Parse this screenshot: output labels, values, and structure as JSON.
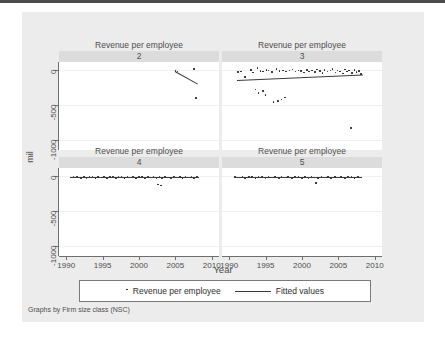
{
  "figure": {
    "axis_title_y": "mil",
    "axis_title_x": "Year",
    "note": "Graphs by Firm size class (NSC)",
    "background": "#ececec",
    "panel_background": "#ffffff",
    "strip_background": "#dcdcdc",
    "marker_color": "#1a1a1a",
    "line_color": "#3a3a3a"
  },
  "legend": {
    "items": [
      {
        "marker": "dot",
        "label": "Revenue per employee"
      },
      {
        "marker": "line",
        "label": "Fitted values"
      }
    ]
  },
  "chart_data": {
    "type": "scatter",
    "title": "",
    "xlabel": "Year",
    "ylabel": "mil",
    "xlim": [
      1989,
      2011
    ],
    "ylim": [
      -1150,
      120
    ],
    "xticks": [
      1990,
      1995,
      2000,
      2005,
      2010
    ],
    "yticks": [
      0,
      -500,
      -1000
    ],
    "ytick_labels": [
      "0",
      "-500",
      "-1000"
    ],
    "xtick_labels": [
      "1990",
      "1995",
      "2000",
      "2005",
      "2010"
    ],
    "grid": "horizontal",
    "legend_position": "bottom",
    "facet_by": "Firm size class (NSC)",
    "panels": [
      {
        "title": "Revenue per employee",
        "subtitle": "2",
        "row": 0,
        "col": 0,
        "points": [
          {
            "x": 2005.0,
            "y": -10
          },
          {
            "x": 2005.3,
            "y": -15
          },
          {
            "x": 2007.6,
            "y": 20
          },
          {
            "x": 2007.8,
            "y": -400
          }
        ],
        "fit": {
          "x0": 2004.9,
          "y0": -5,
          "x1": 2008.0,
          "y1": -185
        }
      },
      {
        "title": "Revenue per employee",
        "subtitle": "3",
        "row": 0,
        "col": 1,
        "points": [
          {
            "x": 1991.2,
            "y": -25
          },
          {
            "x": 1991.6,
            "y": -15
          },
          {
            "x": 1992.2,
            "y": -95
          },
          {
            "x": 1993.0,
            "y": 5
          },
          {
            "x": 1993.3,
            "y": -30
          },
          {
            "x": 1993.9,
            "y": 30
          },
          {
            "x": 1994.3,
            "y": -10
          },
          {
            "x": 1994.6,
            "y": -20
          },
          {
            "x": 1995.1,
            "y": 5
          },
          {
            "x": 1995.4,
            "y": -5
          },
          {
            "x": 1995.9,
            "y": -25
          },
          {
            "x": 1996.5,
            "y": 15
          },
          {
            "x": 1996.9,
            "y": -10
          },
          {
            "x": 1997.4,
            "y": 0
          },
          {
            "x": 1997.8,
            "y": -15
          },
          {
            "x": 1998.3,
            "y": -5
          },
          {
            "x": 1998.7,
            "y": 10
          },
          {
            "x": 1999.1,
            "y": -20
          },
          {
            "x": 1999.5,
            "y": 0
          },
          {
            "x": 1999.9,
            "y": -10
          },
          {
            "x": 2000.3,
            "y": -30
          },
          {
            "x": 2000.7,
            "y": 5
          },
          {
            "x": 2001.0,
            "y": -15
          },
          {
            "x": 2001.4,
            "y": 0
          },
          {
            "x": 2001.8,
            "y": -25
          },
          {
            "x": 2002.1,
            "y": 10
          },
          {
            "x": 2002.5,
            "y": -10
          },
          {
            "x": 2002.8,
            "y": -35
          },
          {
            "x": 2003.1,
            "y": 5
          },
          {
            "x": 2003.5,
            "y": -20
          },
          {
            "x": 2003.9,
            "y": -5
          },
          {
            "x": 2004.2,
            "y": 15
          },
          {
            "x": 2004.6,
            "y": -30
          },
          {
            "x": 2004.9,
            "y": 0
          },
          {
            "x": 2005.2,
            "y": -15
          },
          {
            "x": 2005.6,
            "y": -45
          },
          {
            "x": 2005.9,
            "y": 10
          },
          {
            "x": 2006.2,
            "y": -20
          },
          {
            "x": 2006.5,
            "y": -5
          },
          {
            "x": 2006.9,
            "y": -35
          },
          {
            "x": 2007.2,
            "y": 5
          },
          {
            "x": 2007.5,
            "y": -25
          },
          {
            "x": 2007.8,
            "y": -10
          },
          {
            "x": 2008.1,
            "y": -50
          },
          {
            "x": 1993.6,
            "y": -275
          },
          {
            "x": 1994.0,
            "y": -330
          },
          {
            "x": 1994.6,
            "y": -300
          },
          {
            "x": 1995.0,
            "y": -360
          },
          {
            "x": 1996.1,
            "y": -460
          },
          {
            "x": 1996.7,
            "y": -440
          },
          {
            "x": 1997.2,
            "y": -420
          },
          {
            "x": 1997.7,
            "y": -395
          },
          {
            "x": 2006.7,
            "y": -830
          }
        ],
        "fit": {
          "x0": 1991.0,
          "y0": -135,
          "x1": 2008.3,
          "y1": -55
        }
      },
      {
        "title": "Revenue per employee",
        "subtitle": "4",
        "row": 1,
        "col": 0,
        "points": [
          {
            "x": 1990.6,
            "y": -18
          },
          {
            "x": 1991.0,
            "y": -14
          },
          {
            "x": 1991.5,
            "y": -10
          },
          {
            "x": 1992.0,
            "y": -22
          },
          {
            "x": 1992.4,
            "y": -6
          },
          {
            "x": 1992.8,
            "y": -30
          },
          {
            "x": 1993.2,
            "y": -12
          },
          {
            "x": 1993.6,
            "y": -2
          },
          {
            "x": 1994.0,
            "y": -26
          },
          {
            "x": 1994.4,
            "y": -8
          },
          {
            "x": 1994.8,
            "y": -18
          },
          {
            "x": 1995.2,
            "y": -4
          },
          {
            "x": 1995.6,
            "y": -34
          },
          {
            "x": 1996.0,
            "y": -14
          },
          {
            "x": 1996.4,
            "y": -6
          },
          {
            "x": 1996.8,
            "y": -24
          },
          {
            "x": 1997.2,
            "y": -10
          },
          {
            "x": 1997.6,
            "y": -2
          },
          {
            "x": 1998.0,
            "y": -28
          },
          {
            "x": 1998.4,
            "y": -12
          },
          {
            "x": 1998.8,
            "y": -20
          },
          {
            "x": 1999.2,
            "y": -6
          },
          {
            "x": 1999.6,
            "y": -32
          },
          {
            "x": 2000.0,
            "y": -14
          },
          {
            "x": 2000.4,
            "y": -4
          },
          {
            "x": 2000.8,
            "y": -24
          },
          {
            "x": 2001.2,
            "y": -10
          },
          {
            "x": 2001.6,
            "y": -18
          },
          {
            "x": 2002.0,
            "y": -2
          },
          {
            "x": 2002.4,
            "y": -30
          },
          {
            "x": 2002.8,
            "y": -12
          },
          {
            "x": 2003.2,
            "y": -22
          },
          {
            "x": 2003.6,
            "y": -6
          },
          {
            "x": 2004.0,
            "y": -16
          },
          {
            "x": 2004.4,
            "y": -26
          },
          {
            "x": 2004.8,
            "y": -8
          },
          {
            "x": 2005.2,
            "y": -18
          },
          {
            "x": 2005.6,
            "y": -4
          },
          {
            "x": 2006.0,
            "y": -28
          },
          {
            "x": 2006.4,
            "y": -12
          },
          {
            "x": 2006.8,
            "y": -20
          },
          {
            "x": 2007.2,
            "y": -6
          },
          {
            "x": 2007.6,
            "y": -24
          },
          {
            "x": 2008.0,
            "y": -14
          },
          {
            "x": 2002.6,
            "y": -120
          },
          {
            "x": 2003.0,
            "y": -135
          }
        ],
        "fit": {
          "x0": 1990.5,
          "y0": -16,
          "x1": 2008.2,
          "y1": -16
        }
      },
      {
        "title": "Revenue per employee",
        "subtitle": "5",
        "row": 1,
        "col": 1,
        "points": [
          {
            "x": 1990.8,
            "y": -10
          },
          {
            "x": 1991.3,
            "y": -20
          },
          {
            "x": 1991.8,
            "y": -6
          },
          {
            "x": 1992.2,
            "y": -28
          },
          {
            "x": 1992.7,
            "y": -12
          },
          {
            "x": 1993.1,
            "y": -2
          },
          {
            "x": 1993.6,
            "y": -24
          },
          {
            "x": 1994.0,
            "y": -14
          },
          {
            "x": 1994.5,
            "y": -6
          },
          {
            "x": 1995.0,
            "y": -30
          },
          {
            "x": 1995.4,
            "y": -10
          },
          {
            "x": 1995.9,
            "y": -20
          },
          {
            "x": 1996.3,
            "y": -4
          },
          {
            "x": 1996.8,
            "y": -26
          },
          {
            "x": 1997.2,
            "y": -12
          },
          {
            "x": 1997.7,
            "y": -18
          },
          {
            "x": 1998.1,
            "y": -2
          },
          {
            "x": 1998.6,
            "y": -28
          },
          {
            "x": 1999.0,
            "y": -14
          },
          {
            "x": 1999.5,
            "y": -8
          },
          {
            "x": 2000.0,
            "y": -22
          },
          {
            "x": 2000.4,
            "y": -10
          },
          {
            "x": 2000.9,
            "y": -30
          },
          {
            "x": 2001.3,
            "y": -6
          },
          {
            "x": 2001.8,
            "y": -16
          },
          {
            "x": 2002.2,
            "y": -26
          },
          {
            "x": 2002.7,
            "y": -10
          },
          {
            "x": 2003.1,
            "y": -20
          },
          {
            "x": 2003.6,
            "y": -4
          },
          {
            "x": 2004.0,
            "y": -28
          },
          {
            "x": 2004.5,
            "y": -12
          },
          {
            "x": 2005.0,
            "y": -18
          },
          {
            "x": 2005.4,
            "y": -6
          },
          {
            "x": 2005.9,
            "y": -24
          },
          {
            "x": 2006.3,
            "y": -14
          },
          {
            "x": 2006.8,
            "y": -8
          },
          {
            "x": 2007.2,
            "y": -22
          },
          {
            "x": 2007.7,
            "y": -12
          },
          {
            "x": 2008.1,
            "y": -18
          },
          {
            "x": 2001.9,
            "y": -95
          }
        ],
        "fit": {
          "x0": 1990.8,
          "y0": -16,
          "x1": 2008.2,
          "y1": -16
        }
      }
    ]
  }
}
